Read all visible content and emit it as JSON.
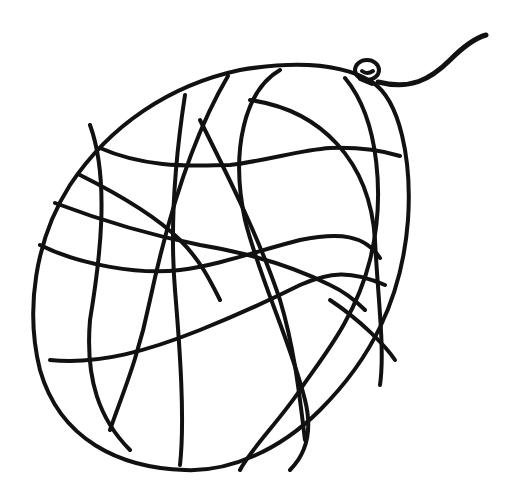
{
  "image": {
    "subject": "balloon line drawing",
    "style": "black outline coloring page",
    "colors": {
      "ink": "#111111",
      "background": "#ffffff"
    },
    "elements": [
      "balloon-outline",
      "net-pattern-lines",
      "balloon-knot",
      "balloon-string"
    ]
  }
}
